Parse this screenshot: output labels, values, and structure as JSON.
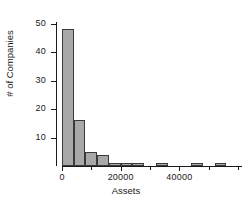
{
  "chart_data": {
    "type": "bar",
    "title": "",
    "subtitle": "",
    "xlabel": "Assets",
    "ylabel": "# of Companies",
    "xlim": [
      0,
      60000
    ],
    "ylim": [
      0,
      52
    ],
    "grid": false,
    "legend": null,
    "bin_width": 4000,
    "bar_color": "#a8a8a8",
    "bar_edge_color": "#3a3a3a",
    "x_ticks": [
      0,
      20000,
      40000
    ],
    "x_tick_labels": [
      "0",
      "20000",
      "40000"
    ],
    "x_minor_ticks": [
      10000,
      30000,
      50000,
      60000
    ],
    "y_ticks": [
      10,
      20,
      30,
      40,
      50
    ],
    "y_tick_labels": [
      "10",
      "20",
      "30",
      "40",
      "50"
    ],
    "bins": [
      {
        "start": 0,
        "end": 4000,
        "count": 48
      },
      {
        "start": 4000,
        "end": 8000,
        "count": 16
      },
      {
        "start": 8000,
        "end": 12000,
        "count": 5
      },
      {
        "start": 12000,
        "end": 16000,
        "count": 4
      },
      {
        "start": 16000,
        "end": 20000,
        "count": 1
      },
      {
        "start": 20000,
        "end": 24000,
        "count": 1
      },
      {
        "start": 24000,
        "end": 28000,
        "count": 1
      },
      {
        "start": 28000,
        "end": 32000,
        "count": 0
      },
      {
        "start": 32000,
        "end": 36000,
        "count": 1
      },
      {
        "start": 36000,
        "end": 40000,
        "count": 0
      },
      {
        "start": 40000,
        "end": 44000,
        "count": 0
      },
      {
        "start": 44000,
        "end": 48000,
        "count": 1
      },
      {
        "start": 48000,
        "end": 52000,
        "count": 0
      },
      {
        "start": 52000,
        "end": 56000,
        "count": 1
      },
      {
        "start": 56000,
        "end": 60000,
        "count": 0
      }
    ],
    "categories": [
      "0-4000",
      "4000-8000",
      "8000-12000",
      "12000-16000",
      "16000-20000",
      "20000-24000",
      "24000-28000",
      "28000-32000",
      "32000-36000",
      "36000-40000",
      "40000-44000",
      "44000-48000",
      "48000-52000",
      "52000-56000",
      "56000-60000"
    ],
    "values": [
      48,
      16,
      5,
      4,
      1,
      1,
      1,
      0,
      1,
      0,
      0,
      1,
      0,
      1,
      0
    ]
  }
}
